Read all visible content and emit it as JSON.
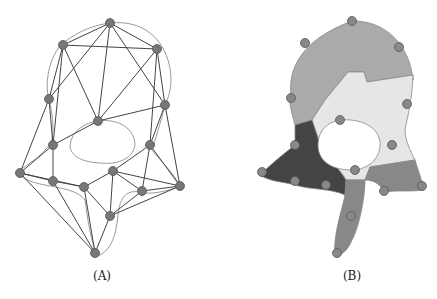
{
  "panels": [
    {
      "id": "A",
      "label": "(A)",
      "description": "mesh graph with contour"
    },
    {
      "id": "B",
      "label": "(B)",
      "description": "segmented region map with nodes"
    }
  ],
  "colors": {
    "node": "#777777",
    "edge": "#444444",
    "contour": "#999999",
    "region_light": "#e6e6e6",
    "region_mid": "#aaaaaa",
    "region_dark": "#444444",
    "region_gray": "#888888"
  }
}
